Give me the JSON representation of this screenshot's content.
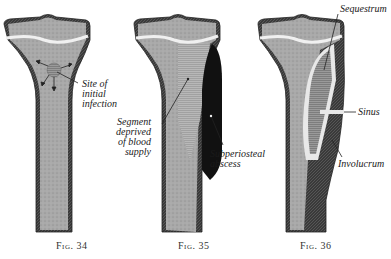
{
  "figures": [
    {
      "id": "fig34",
      "caption": "Fig. 34",
      "labels": [
        {
          "key": "site",
          "text": "Site of\ninitial\ninfection"
        }
      ]
    },
    {
      "id": "fig35",
      "caption": "Fig. 35",
      "labels": [
        {
          "key": "segment",
          "text": "Segment\ndeprived\nof blood\nsupply"
        },
        {
          "key": "abscess",
          "text": "Subperiosteal\nabscess"
        }
      ]
    },
    {
      "id": "fig36",
      "caption": "Fig. 36",
      "labels": [
        {
          "key": "sequestrum",
          "text": "Sequestrum"
        },
        {
          "key": "sinus",
          "text": "Sinus"
        },
        {
          "key": "involucrum",
          "text": "Involucrum"
        }
      ]
    }
  ],
  "colors": {
    "bone_fill": "#a8a8a8",
    "cortex": "#3a3a3a",
    "growth_plate": "#f0f0f0",
    "abscess": "#111111",
    "sequestrum": "#8a8a8a"
  }
}
